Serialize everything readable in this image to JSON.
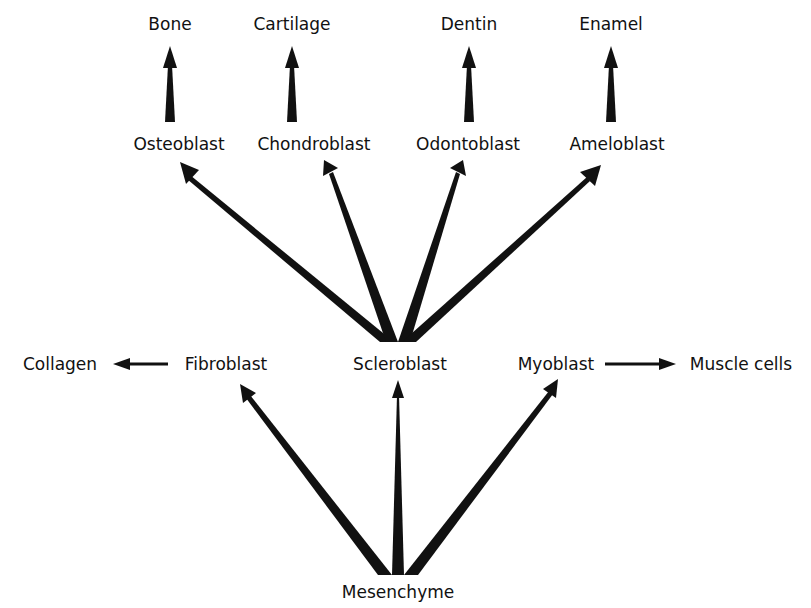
{
  "diagram": {
    "title": "",
    "colors": {
      "ink": "#111111",
      "background": "#ffffff"
    },
    "nodes": {
      "bone": "Bone",
      "cartilage": "Cartilage",
      "dentin": "Dentin",
      "enamel": "Enamel",
      "osteoblast": "Osteoblast",
      "chondroblast": "Chondroblast",
      "odontoblast": "Odontoblast",
      "ameloblast": "Ameloblast",
      "collagen": "Collagen",
      "fibroblast": "Fibroblast",
      "scleroblast": "Scleroblast",
      "myoblast": "Myoblast",
      "muscle_cells": "Muscle cells",
      "mesenchyme": "Mesenchyme"
    },
    "edges": [
      {
        "from": "Osteoblast",
        "to": "Bone"
      },
      {
        "from": "Chondroblast",
        "to": "Cartilage"
      },
      {
        "from": "Odontoblast",
        "to": "Dentin"
      },
      {
        "from": "Ameloblast",
        "to": "Enamel"
      },
      {
        "from": "Scleroblast",
        "to": "Osteoblast"
      },
      {
        "from": "Scleroblast",
        "to": "Chondroblast"
      },
      {
        "from": "Scleroblast",
        "to": "Odontoblast"
      },
      {
        "from": "Scleroblast",
        "to": "Ameloblast"
      },
      {
        "from": "Fibroblast",
        "to": "Collagen"
      },
      {
        "from": "Myoblast",
        "to": "Muscle cells"
      },
      {
        "from": "Mesenchyme",
        "to": "Fibroblast"
      },
      {
        "from": "Mesenchyme",
        "to": "Scleroblast"
      },
      {
        "from": "Mesenchyme",
        "to": "Myoblast"
      }
    ]
  }
}
